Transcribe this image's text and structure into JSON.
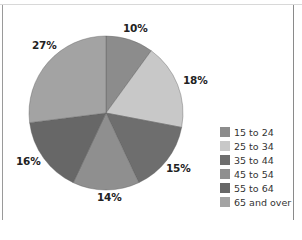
{
  "chart_data": {
    "type": "pie",
    "title": "",
    "categories": [
      "15 to 24",
      "25 to 34",
      "35 to 44",
      "45 to 54",
      "55 to 64",
      "65 and over"
    ],
    "values": [
      10,
      18,
      15,
      14,
      16,
      27
    ],
    "labels": [
      "10%",
      "18%",
      "15%",
      "14%",
      "16%",
      "27%"
    ],
    "colors": [
      "#8c8c8c",
      "#c8c8c8",
      "#6e6e6e",
      "#8f8f8f",
      "#676767",
      "#a3a3a3"
    ],
    "start_angle": "12 o'clock",
    "direction": "clockwise",
    "legend_position": "right-bottom"
  },
  "legend": {
    "items": [
      {
        "label": "15 to 24",
        "color": "#8c8c8c"
      },
      {
        "label": "25 to 34",
        "color": "#c8c8c8"
      },
      {
        "label": "35 to 44",
        "color": "#6e6e6e"
      },
      {
        "label": "45 to 54",
        "color": "#8f8f8f"
      },
      {
        "label": "55 to 64",
        "color": "#676767"
      },
      {
        "label": "65 and over",
        "color": "#a3a3a3"
      }
    ]
  },
  "slice_labels": {
    "s0": "10%",
    "s1": "18%",
    "s2": "15%",
    "s3": "14%",
    "s4": "16%",
    "s5": "27%"
  }
}
